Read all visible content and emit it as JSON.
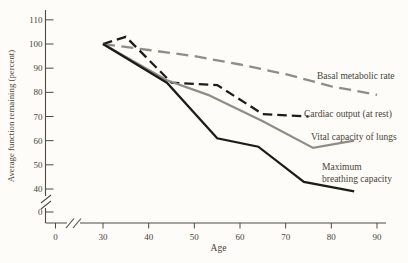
{
  "figure": {
    "background": "#fdfcf8",
    "axis_color": "#4e4a42",
    "text_color": "#4a4337"
  },
  "chart_data": {
    "type": "line",
    "title": "",
    "xlabel": "Age",
    "ylabel": "Average function remaining (percent)",
    "x_ticks": [
      0,
      30,
      40,
      50,
      60,
      70,
      80,
      90
    ],
    "y_ticks": [
      0,
      40,
      50,
      60,
      70,
      80,
      90,
      100,
      110
    ],
    "x_axis_break": "between 0 and 30",
    "y_axis_break": "between 0 and 40",
    "xlim": [
      0,
      90
    ],
    "ylim": [
      0,
      110
    ],
    "grid": false,
    "legend_position": "labels next to lines",
    "series": [
      {
        "name": "Basal metabolic rate",
        "line_style": "dashed",
        "color": "#8e8e85",
        "dash": "12 6.5",
        "x": [
          30,
          40,
          50,
          60,
          70,
          80,
          90
        ],
        "values": [
          100,
          97.5,
          95,
          91.5,
          87.5,
          82.5,
          79
        ],
        "label": [
          "Basal metabolic rate"
        ],
        "label_xy": [
          317,
          79
        ]
      },
      {
        "name": "Cardiac output (at rest)",
        "line_style": "dashed",
        "color": "#1d1c19",
        "dash": "9.5 5",
        "x": [
          30,
          35,
          45,
          55,
          65,
          75
        ],
        "values": [
          100,
          103,
          84,
          83,
          71,
          70
        ],
        "label": [
          "Cardiac output (at rest)"
        ],
        "label_xy": [
          304,
          117
        ]
      },
      {
        "name": "Vital capacity of lungs",
        "line_style": "solid",
        "color": "#8e8e85",
        "dash": "",
        "x": [
          30,
          44,
          53,
          65,
          76,
          85
        ],
        "values": [
          100,
          85,
          79,
          68,
          57,
          60
        ],
        "label": [
          "Vital capacity of lungs"
        ],
        "label_xy": [
          311,
          140
        ]
      },
      {
        "name": "Maximum breathing capacity",
        "line_style": "solid",
        "color": "#1d1c19",
        "dash": "",
        "x": [
          30,
          44,
          55,
          64,
          74,
          85
        ],
        "values": [
          100,
          84,
          61,
          57.5,
          43,
          39
        ],
        "label": [
          "Maximum",
          "breathing capacity"
        ],
        "label_xy": [
          322,
          170
        ]
      }
    ]
  }
}
